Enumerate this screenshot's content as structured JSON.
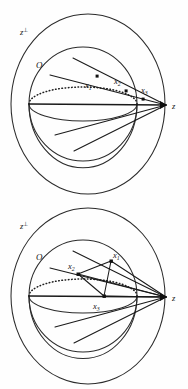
{
  "figure": {
    "background_color": "#fefefe",
    "ink_color": "#1a1a1a",
    "width": 188,
    "height": 389,
    "panel_count": 2
  },
  "labels": {
    "hyperplane": "z",
    "hyperplane_superscript": "⊥",
    "center": "O",
    "focus": "z",
    "x1": "x",
    "x1_sub": "1",
    "x2": "x",
    "x2_sub": "2",
    "x3": "x",
    "x3_sub": "3"
  },
  "panels": [
    {
      "id": "top",
      "name": "collinear-points-panel",
      "description": "Points x1, x2, x3 lie along a single ray from the sphere toward z",
      "outer_ellipse": {
        "cx": 88,
        "cy": 104,
        "rx": 78,
        "ry": 92
      },
      "sphere": {
        "cx": 83,
        "cy": 104,
        "rx": 54,
        "ry": 58
      },
      "equator": {
        "cx": 83,
        "cy": 104,
        "rx": 54,
        "ry": 17
      },
      "focus_point": {
        "x": 166,
        "y": 105
      },
      "points": [
        {
          "label": "x1",
          "x": 98,
          "y": 78,
          "label_x": 86,
          "label_y": 87
        },
        {
          "label": "x2",
          "x": 127,
          "y": 88,
          "label_x": 117,
          "label_y": 84
        },
        {
          "label": "x3",
          "x": 143,
          "y": 96,
          "label_x": 142,
          "label_y": 92
        }
      ],
      "ray_count": 5
    },
    {
      "id": "bottom",
      "name": "triangle-points-panel",
      "description": "Points x1, x2, x3 form a triangle inside the sphere with rays to z",
      "outer_ellipse": {
        "cx": 88,
        "cy": 104,
        "rx": 78,
        "ry": 92
      },
      "sphere": {
        "cx": 83,
        "cy": 104,
        "rx": 54,
        "ry": 58
      },
      "equator": {
        "cx": 83,
        "cy": 104,
        "rx": 54,
        "ry": 17
      },
      "focus_point": {
        "x": 166,
        "y": 105
      },
      "points": [
        {
          "label": "x1",
          "x": 111,
          "y": 69,
          "label_x": 113,
          "label_y": 64
        },
        {
          "label": "x2",
          "x": 78,
          "y": 82,
          "label_x": 71,
          "label_y": 75
        },
        {
          "label": "x3",
          "x": 104,
          "y": 104,
          "label_x": 94,
          "label_y": 114
        }
      ],
      "ray_count": 6
    }
  ]
}
